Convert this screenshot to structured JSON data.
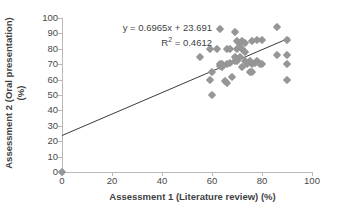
{
  "chart_data": {
    "type": "scatter",
    "title": "",
    "xlabel": "Assessment 1 (Literature review) (%)",
    "ylabel_line1": "Assessment 2 (Oral presentation)",
    "ylabel_line2": "(%)",
    "xlim": [
      0,
      100
    ],
    "ylim": [
      0,
      100
    ],
    "x_ticks": [
      0,
      20,
      40,
      60,
      80,
      100
    ],
    "y_ticks": [
      0,
      10,
      20,
      30,
      40,
      50,
      60,
      70,
      80,
      90,
      100
    ],
    "grid": false,
    "legend": "none",
    "marker_color": "#969696",
    "marker_shape": "diamond",
    "trendline": {
      "equation_label": "y = 0.6965x + 23.691",
      "r2_label_prefix": "R",
      "r2_label_sup": "2",
      "r2_label_suffix": " = 0.4612",
      "slope": 0.6965,
      "intercept": 23.691,
      "r_squared": 0.4612,
      "color": "#3a3a3a",
      "x_start": 0,
      "x_end": 91
    },
    "points": [
      [
        0,
        0
      ],
      [
        55,
        75
      ],
      [
        59,
        80
      ],
      [
        59,
        60
      ],
      [
        60,
        50
      ],
      [
        60,
        65
      ],
      [
        62,
        80
      ],
      [
        63,
        93
      ],
      [
        63,
        70
      ],
      [
        63,
        69
      ],
      [
        64,
        70
      ],
      [
        64,
        68
      ],
      [
        65,
        59
      ],
      [
        66,
        58
      ],
      [
        66,
        80
      ],
      [
        66,
        70
      ],
      [
        67,
        71
      ],
      [
        67,
        80
      ],
      [
        68,
        62
      ],
      [
        69,
        91
      ],
      [
        69,
        75
      ],
      [
        69,
        72
      ],
      [
        70,
        85
      ],
      [
        70,
        80
      ],
      [
        70,
        72
      ],
      [
        71,
        83
      ],
      [
        71,
        75
      ],
      [
        72,
        85
      ],
      [
        72,
        80
      ],
      [
        72,
        68
      ],
      [
        73,
        84
      ],
      [
        73,
        78
      ],
      [
        73,
        72
      ],
      [
        74,
        70
      ],
      [
        75,
        72
      ],
      [
        75,
        65
      ],
      [
        76,
        85
      ],
      [
        76,
        70
      ],
      [
        76,
        65
      ],
      [
        77,
        71
      ],
      [
        78,
        86
      ],
      [
        78,
        72
      ],
      [
        79,
        70
      ],
      [
        80,
        86
      ],
      [
        80,
        70
      ],
      [
        86,
        94
      ],
      [
        86,
        76
      ],
      [
        90,
        86
      ],
      [
        90,
        76
      ],
      [
        90,
        70
      ],
      [
        90,
        60
      ]
    ]
  }
}
